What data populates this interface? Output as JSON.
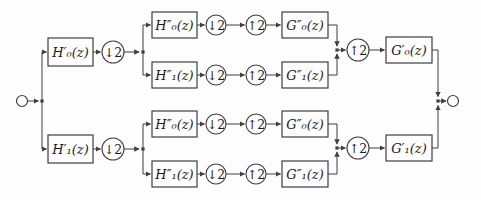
{
  "colors": {
    "line": "#3f3f3f",
    "ink": "#1c1c1c",
    "background": "#fdfdfd"
  },
  "diagram": {
    "downsampler_label": "↓2",
    "upsampler_label": "↑2",
    "analysis_stage1": {
      "top": "H′₀(z)",
      "bottom": "H′₁(z)"
    },
    "analysis_stage2": {
      "lowpass": "H″₀(z)",
      "highpass": "H″₁(z)"
    },
    "synthesis_stage2": {
      "lowpass": "G″₀(z)",
      "highpass": "G″₁(z)"
    },
    "synthesis_stage1": {
      "top": "G′₀(z)",
      "bottom": "G′₁(z)"
    }
  }
}
